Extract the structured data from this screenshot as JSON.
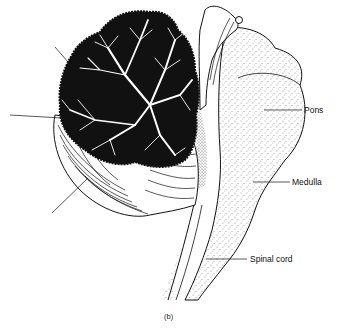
{
  "figure": {
    "panel_label": "(b)",
    "labels": {
      "pons": "Pons",
      "medulla": "Medulla",
      "spinal_cord": "Spinal cord"
    },
    "unlabeled_leaders": 3,
    "colors": {
      "ink": "#111111",
      "background": "#ffffff"
    }
  }
}
